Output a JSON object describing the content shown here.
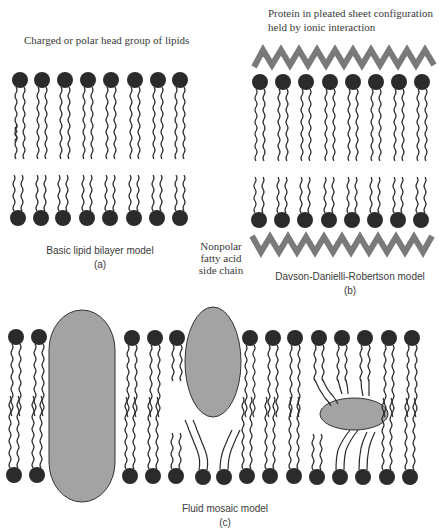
{
  "panel_a": {
    "head_label": "Charged or polar head group of lipids",
    "title": "Basic lipid bilayer model",
    "letter": "(a)"
  },
  "panel_b": {
    "protein_label_line1": "Protein in pleated sheet configuration",
    "protein_label_line2": "held by ionic interaction",
    "title": "Davson-Danielli-Robertson model",
    "letter": "(b)"
  },
  "tail_label": {
    "line1": "Nonpolar",
    "line2": "fatty acid",
    "line3": "side chain"
  },
  "panel_c": {
    "title": "Fluid mosaic model",
    "letter": "(c)"
  },
  "colors": {
    "head": "#2b2b2b",
    "tail": "#2b2b2b",
    "protein_fill": "#a3a3a3",
    "zigzag": "#7a7a7a"
  }
}
